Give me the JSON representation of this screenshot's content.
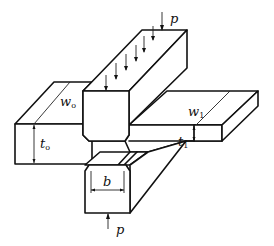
{
  "figure": {
    "labels": {
      "load_top": "p",
      "load_bottom": "p",
      "initial_width": {
        "main": "w",
        "sub": "o"
      },
      "final_width": {
        "main": "w",
        "sub": "1"
      },
      "initial_thickness": {
        "main": "t",
        "sub": "o"
      },
      "final_thickness": {
        "main": "t",
        "sub": "1"
      },
      "die_breadth": "b"
    },
    "colors": {
      "line": "#111111",
      "background": "#ffffff"
    }
  }
}
